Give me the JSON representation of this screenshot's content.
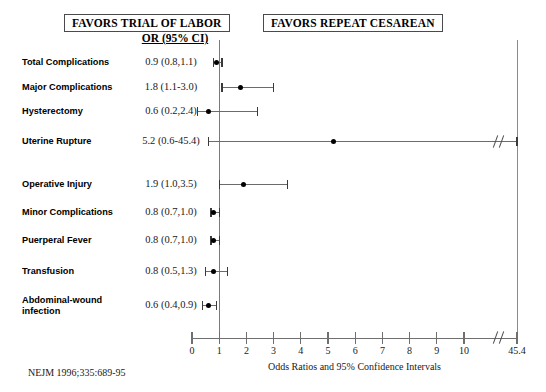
{
  "header": {
    "left_box": "FAVORS TRIAL OF LABOR",
    "right_box": "FAVORS REPEAT CESAREAN",
    "or_column_header": "OR (95% CI)"
  },
  "axis": {
    "title": "Odds Ratios and 95% Confidence Intervals",
    "tick_labels": [
      "0",
      "1",
      "2",
      "3",
      "4",
      "5",
      "6",
      "7",
      "8",
      "9",
      "10",
      "45.4"
    ],
    "tick_values": [
      0,
      1,
      2,
      3,
      4,
      5,
      6,
      7,
      8,
      9,
      10,
      45.4
    ],
    "has_break": true,
    "break_after": 10,
    "reference_value": 1
  },
  "footnote": "NEJM 1996;335:689-95",
  "chart_data": {
    "type": "forest",
    "title": "",
    "xlabel": "Odds Ratios and 95% Confidence Intervals",
    "ylabel": "",
    "xlim": [
      0,
      45.4
    ],
    "axis_break": [
      10,
      45.4
    ],
    "reference_line": 1,
    "grid": false,
    "legend": [
      "FAVORS TRIAL OF LABOR",
      "FAVORS REPEAT CESAREAN"
    ],
    "legend_position": "top",
    "categories": [
      "Total Complications",
      "Major Complications",
      "Hysterectomy",
      "Uterine Rupture",
      "Operative Injury",
      "Minor Complications",
      "Puerperal Fever",
      "Transfusion",
      "Abdominal-wound infection"
    ],
    "points": [
      {
        "label": "Total Complications",
        "or": 0.9,
        "lo": 0.8,
        "hi": 1.1,
        "text": "0.9 (0.8,1.1)"
      },
      {
        "label": "Major Complications",
        "or": 1.8,
        "lo": 1.1,
        "hi": 3.0,
        "text": "1.8 (1.1-3.0)"
      },
      {
        "label": "Hysterectomy",
        "or": 0.6,
        "lo": 0.2,
        "hi": 2.4,
        "text": "0.6 (0.2,2.4)"
      },
      {
        "label": "Uterine Rupture",
        "or": 5.2,
        "lo": 0.6,
        "hi": 45.4,
        "text": "5.2 (0.6-45.4)"
      },
      {
        "label": "Operative Injury",
        "or": 1.9,
        "lo": 1.0,
        "hi": 3.5,
        "text": "1.9 (1.0,3.5)"
      },
      {
        "label": "Minor Complications",
        "or": 0.8,
        "lo": 0.7,
        "hi": 1.0,
        "text": "0.8 (0.7,1.0)"
      },
      {
        "label": "Puerperal Fever",
        "or": 0.8,
        "lo": 0.7,
        "hi": 1.0,
        "text": "0.8 (0.7,1.0)"
      },
      {
        "label": "Transfusion",
        "or": 0.8,
        "lo": 0.5,
        "hi": 1.3,
        "text": "0.8 (0.5,1.3)"
      },
      {
        "label": "Abdominal-wound infection",
        "or": 0.6,
        "lo": 0.4,
        "hi": 0.9,
        "text": "0.6 (0.4,0.9)"
      }
    ]
  },
  "rows": [
    {
      "label_line1": "Total Complications",
      "label_line2": "",
      "or_text": "0.9 (0.8,1.1)"
    },
    {
      "label_line1": "Major Complications",
      "label_line2": "",
      "or_text": "1.8 (1.1-3.0)"
    },
    {
      "label_line1": "Hysterectomy",
      "label_line2": "",
      "or_text": "0.6 (0.2,2.4)"
    },
    {
      "label_line1": "Uterine Rupture",
      "label_line2": "",
      "or_text": "5.2 (0.6-45.4)"
    },
    {
      "label_line1": "Operative Injury",
      "label_line2": "",
      "or_text": "1.9 (1.0,3.5)"
    },
    {
      "label_line1": "Minor Complications",
      "label_line2": "",
      "or_text": "0.8 (0.7,1.0)"
    },
    {
      "label_line1": "Puerperal Fever",
      "label_line2": "",
      "or_text": "0.8 (0.7,1.0)"
    },
    {
      "label_line1": "Transfusion",
      "label_line2": "",
      "or_text": "0.8 (0.5,1.3)"
    },
    {
      "label_line1": "Abdominal-wound",
      "label_line2": "infection",
      "or_text": "0.6 (0.4,0.9)"
    }
  ],
  "colors": {
    "point": "#000000",
    "ci": "#6b6b6b",
    "axis": "#6f6f6f",
    "reference": "#7a7a7a",
    "text": "#000000",
    "background": "#ffffff"
  }
}
